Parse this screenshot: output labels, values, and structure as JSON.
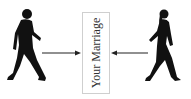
{
  "diagram": {
    "center_label": "Your Marriage",
    "left_figure": {
      "icon": "man-walking-icon",
      "direction": "right"
    },
    "right_figure": {
      "icon": "woman-walking-icon",
      "direction": "left"
    },
    "arrows": [
      {
        "from": "left_figure",
        "to": "center_box",
        "icon": "arrow-right-icon"
      },
      {
        "from": "right_figure",
        "to": "center_box",
        "icon": "arrow-left-icon"
      }
    ],
    "colors": {
      "figure": "#111111",
      "arrow": "#222222",
      "box_border": "#cfcfcf",
      "text": "#333333"
    }
  }
}
